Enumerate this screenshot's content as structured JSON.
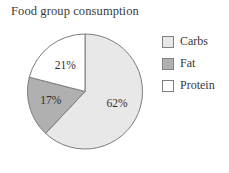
{
  "chart_data": {
    "type": "pie",
    "title": "Food group consumption",
    "categories": [
      "Carbs",
      "Fat",
      "Protein"
    ],
    "values": [
      62,
      17,
      21
    ],
    "value_labels": [
      "62%",
      "17%",
      "21%"
    ],
    "unit": "percent",
    "colors": [
      "#e8e8e8",
      "#b0b0b0",
      "#ffffff"
    ],
    "slice_outline_color": "#7d7d7d",
    "start_angle_deg": 0,
    "direction": "clockwise",
    "legend_position": "right",
    "grid": false,
    "xlabel": "",
    "ylabel": "",
    "slices": [
      {
        "label": "Carbs",
        "value": 62,
        "value_label": "62%",
        "color": "#e8e8e8"
      },
      {
        "label": "Fat",
        "value": 17,
        "value_label": "17%",
        "color": "#b0b0b0"
      },
      {
        "label": "Protein",
        "value": 21,
        "value_label": "21%",
        "color": "#ffffff"
      }
    ]
  },
  "legend": {
    "items": [
      {
        "label": "Carbs",
        "color": "#e8e8e8"
      },
      {
        "label": "Fat",
        "color": "#b0b0b0"
      },
      {
        "label": "Protein",
        "color": "#ffffff"
      }
    ]
  }
}
